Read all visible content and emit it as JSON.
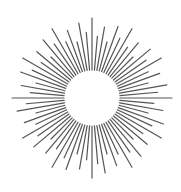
{
  "graphic": {
    "type": "sunburst",
    "center": [
      92,
      98
    ],
    "inner_radius": 27,
    "ray_count": 72,
    "ray_lengths_pattern": [
      80,
      62,
      72,
      58,
      76,
      66
    ],
    "ray_color": "#555555",
    "ray_width": 1.2,
    "background": "#ffffff"
  }
}
